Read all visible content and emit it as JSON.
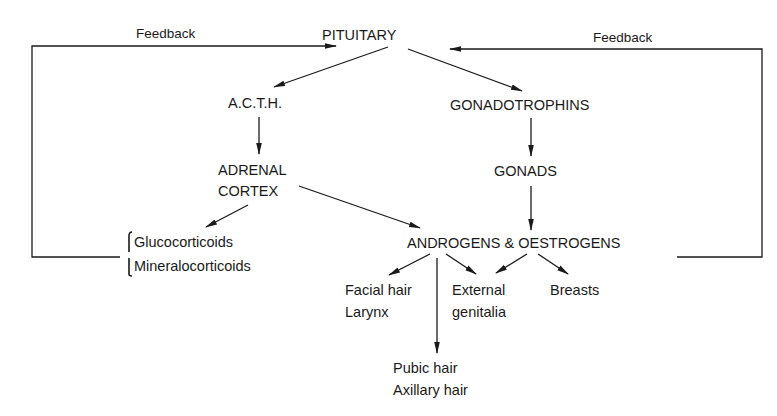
{
  "diagram": {
    "nodes": {
      "pituitary": "PITUITARY",
      "acth": "A.C.T.H.",
      "gonadotrophins": "GONADOTROPHINS",
      "adrenal_cortex_line1": "ADRENAL",
      "adrenal_cortex_line2": "CORTEX",
      "gonads": "GONADS",
      "glucocorticoids": "Glucocorticoids",
      "mineralocorticoids": "Mineralocorticoids",
      "androgens_oestrogens": "ANDROGENS & OESTROGENS",
      "facial_hair": "Facial hair",
      "larynx": "Larynx",
      "external_line1": "External",
      "external_line2": "genitalia",
      "breasts": "Breasts",
      "pubic_hair": "Pubic hair",
      "axillary_hair": "Axillary hair"
    },
    "feedback_left": "Feedback",
    "feedback_right": "Feedback",
    "edges": [
      {
        "from": "PITUITARY",
        "to": "A.C.T.H."
      },
      {
        "from": "PITUITARY",
        "to": "GONADOTROPHINS"
      },
      {
        "from": "A.C.T.H.",
        "to": "ADRENAL CORTEX"
      },
      {
        "from": "GONADOTROPHINS",
        "to": "GONADS"
      },
      {
        "from": "ADRENAL CORTEX",
        "to": "Glucocorticoids/Mineralocorticoids"
      },
      {
        "from": "ADRENAL CORTEX",
        "to": "ANDROGENS & OESTROGENS"
      },
      {
        "from": "GONADS",
        "to": "ANDROGENS & OESTROGENS"
      },
      {
        "from": "ANDROGENS & OESTROGENS",
        "to": "Facial hair / Larynx"
      },
      {
        "from": "ANDROGENS & OESTROGENS",
        "to": "Pubic hair / Axillary hair"
      },
      {
        "from": "ANDROGENS & OESTROGENS",
        "to": "External genitalia"
      },
      {
        "from": "ANDROGENS & OESTROGENS",
        "to": "Breasts"
      },
      {
        "from": "Glucocorticoids/Mineralocorticoids",
        "to": "PITUITARY",
        "label": "Feedback"
      },
      {
        "from": "ANDROGENS & OESTROGENS",
        "to": "PITUITARY",
        "label": "Feedback"
      }
    ],
    "colors": {
      "ink": "#1a1a1a",
      "background": "#ffffff"
    }
  }
}
